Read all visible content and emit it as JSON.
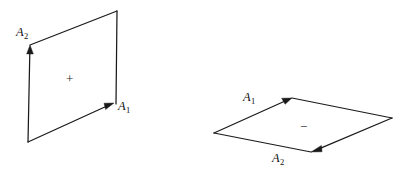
{
  "figure": {
    "background_color": "#ffffff",
    "stroke_color": "#1a1a1a",
    "panels": [
      {
        "id": "positive-orientation",
        "sign_symbol": "+",
        "sign_position": {
          "x": 66,
          "y": 72
        },
        "vertices": {
          "origin": {
            "x": 28,
            "y": 142
          },
          "a1_tip": {
            "x": 114,
            "y": 103
          },
          "far_corner": {
            "x": 117,
            "y": 11
          },
          "a2_tip": {
            "x": 30,
            "y": 45
          }
        },
        "vectors": [
          {
            "name": "A1",
            "label_text": "A",
            "label_sub": "1",
            "label_position": {
              "x": 118,
              "y": 100
            },
            "from": {
              "x": 28,
              "y": 142
            },
            "to": {
              "x": 114,
              "y": 103
            }
          },
          {
            "name": "A2",
            "label_text": "A",
            "label_sub": "2",
            "label_position": {
              "x": 16,
              "y": 26
            },
            "from": {
              "x": 28,
              "y": 142
            },
            "to": {
              "x": 30,
              "y": 45
            }
          }
        ]
      },
      {
        "id": "negative-orientation",
        "sign_symbol": "−",
        "sign_position": {
          "x": 300,
          "y": 120
        },
        "vertices": {
          "left": {
            "x": 214,
            "y": 133
          },
          "top": {
            "x": 292,
            "y": 98
          },
          "right": {
            "x": 392,
            "y": 118
          },
          "bottom": {
            "x": 311,
            "y": 152
          }
        },
        "vectors": [
          {
            "name": "A1",
            "label_text": "A",
            "label_sub": "1",
            "label_position": {
              "x": 243,
              "y": 91
            },
            "from": {
              "x": 214,
              "y": 133
            },
            "to": {
              "x": 292,
              "y": 98
            }
          },
          {
            "name": "A2",
            "label_text": "A",
            "label_sub": "2",
            "label_position": {
              "x": 272,
              "y": 152
            },
            "from": {
              "x": 392,
              "y": 118
            },
            "to": {
              "x": 311,
              "y": 152
            }
          }
        ]
      }
    ]
  }
}
